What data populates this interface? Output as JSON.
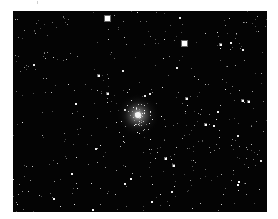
{
  "image": {
    "subject": "star field with globular cluster",
    "background_color": "#040404",
    "frame": {
      "x": 13,
      "y": 11,
      "width": 254,
      "height": 201
    },
    "cluster": {
      "cx": 125,
      "cy": 104,
      "core_radius": 6,
      "halo_radius": 22,
      "member_stars": 70
    },
    "bright_stars": [
      {
        "x": 94,
        "y": 7,
        "size": 4
      },
      {
        "x": 171,
        "y": 32,
        "size": 4
      },
      {
        "x": 85,
        "y": 64,
        "size": 2
      },
      {
        "x": 173,
        "y": 87,
        "size": 2
      },
      {
        "x": 229,
        "y": 89,
        "size": 2
      },
      {
        "x": 235,
        "y": 90,
        "size": 2
      },
      {
        "x": 192,
        "y": 113,
        "size": 2
      },
      {
        "x": 152,
        "y": 147,
        "size": 2
      },
      {
        "x": 160,
        "y": 154,
        "size": 2
      },
      {
        "x": 207,
        "y": 33,
        "size": 2
      },
      {
        "x": 94,
        "y": 82,
        "size": 2
      }
    ],
    "field_star_count": 420,
    "seed": 7
  }
}
